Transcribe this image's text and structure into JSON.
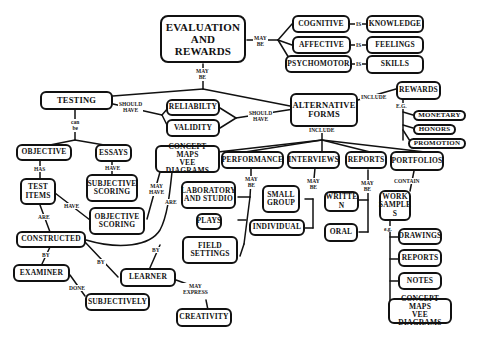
{
  "diagram": {
    "nodes": {
      "evaluation": "EVALUATION\nAND\nREWARDS",
      "cognitive": "COGNITIVE",
      "affective": "AFFECTIVE",
      "psychomotor": "PSYCHOMOTOR",
      "knowledge": "KNOWLEDGE",
      "feelings": "FEELINGS",
      "skills": "SKILLS",
      "testing": "TESTING",
      "reliability": "RELIABILTY",
      "validity": "VALIDITY",
      "alternative": "ALTERNATIVE\nFORMS",
      "rewards": "REWARDS",
      "monetary": "MONETARY",
      "honors": "HONORS",
      "promotion": "PROMOTION",
      "objective": "OBJECTIVE",
      "essays": "ESSAYS",
      "test_items": "TEST\nITEMS",
      "subjective_scoring": "SUBJECTIVE\nSCORING",
      "objective_scoring": "OBJECTIVE\nSCORING",
      "constructed": "CONSTRUCTED",
      "examiner": "EXAMINER",
      "subjectively": "SUBJECTIVELY",
      "learner": "LEARNER",
      "creativity": "CREATIVITY",
      "concept_maps": "CONCEPT MAPS\nVEE DIAGRAMS",
      "performance": "PERFORMANCE",
      "interviews": "INTERVIEWS",
      "reports": "REPORTS",
      "portfolios": "PORTFOLIOS",
      "laboratory": "LABORATORY\nAND STUDIO",
      "plays": "PLAYS",
      "field_settings": "FIELD\nSETTINGS",
      "small_group": "SMALL\nGROUP",
      "individual": "INDIVIDUAL",
      "written": "WRITTE\nN",
      "oral": "ORAL",
      "work_samples": "WORK\nSAMPLE\nS",
      "drawings": "DRAWINGS",
      "ws_reports": "REPORTS",
      "notes": "NOTES",
      "ws_concept_maps": "CONCEPT MAPS\nVEE DIAGRAMS"
    },
    "links": {
      "eval_domains": "MAY\nBE",
      "eval_branch": "MAY\nBE",
      "is1": "IS",
      "is2": "IS",
      "is3": "IS",
      "testing_should": "SHOULD\nHAVE",
      "alt_should": "SHOULD\nHAVE",
      "alt_include_rewards": "INCLUDE",
      "rewards_eg": "E.G.",
      "alt_include": "INCLUDE",
      "testing_can_be": "can\nbe",
      "objective_has": "HAS",
      "essays_have": "HAVE",
      "test_items_have": "HAVE",
      "test_items_are": "ARE",
      "constructed_by_examiner": "BY",
      "constructed_by_learner": "BY",
      "examiner_done": "DONE",
      "learner_may_express": "MAY\nEXPRESS",
      "concept_may_have": "MAY\nHAVE",
      "concept_are": "ARE",
      "learner_by": "BY",
      "performance_may_be": "MAY\nBE",
      "interviews_may_be": "MAY\nBE",
      "reports_may_be": "MAY\nBE",
      "portfolios_contain": "CONTAIN",
      "work_samples_eg": "e.g."
    }
  }
}
